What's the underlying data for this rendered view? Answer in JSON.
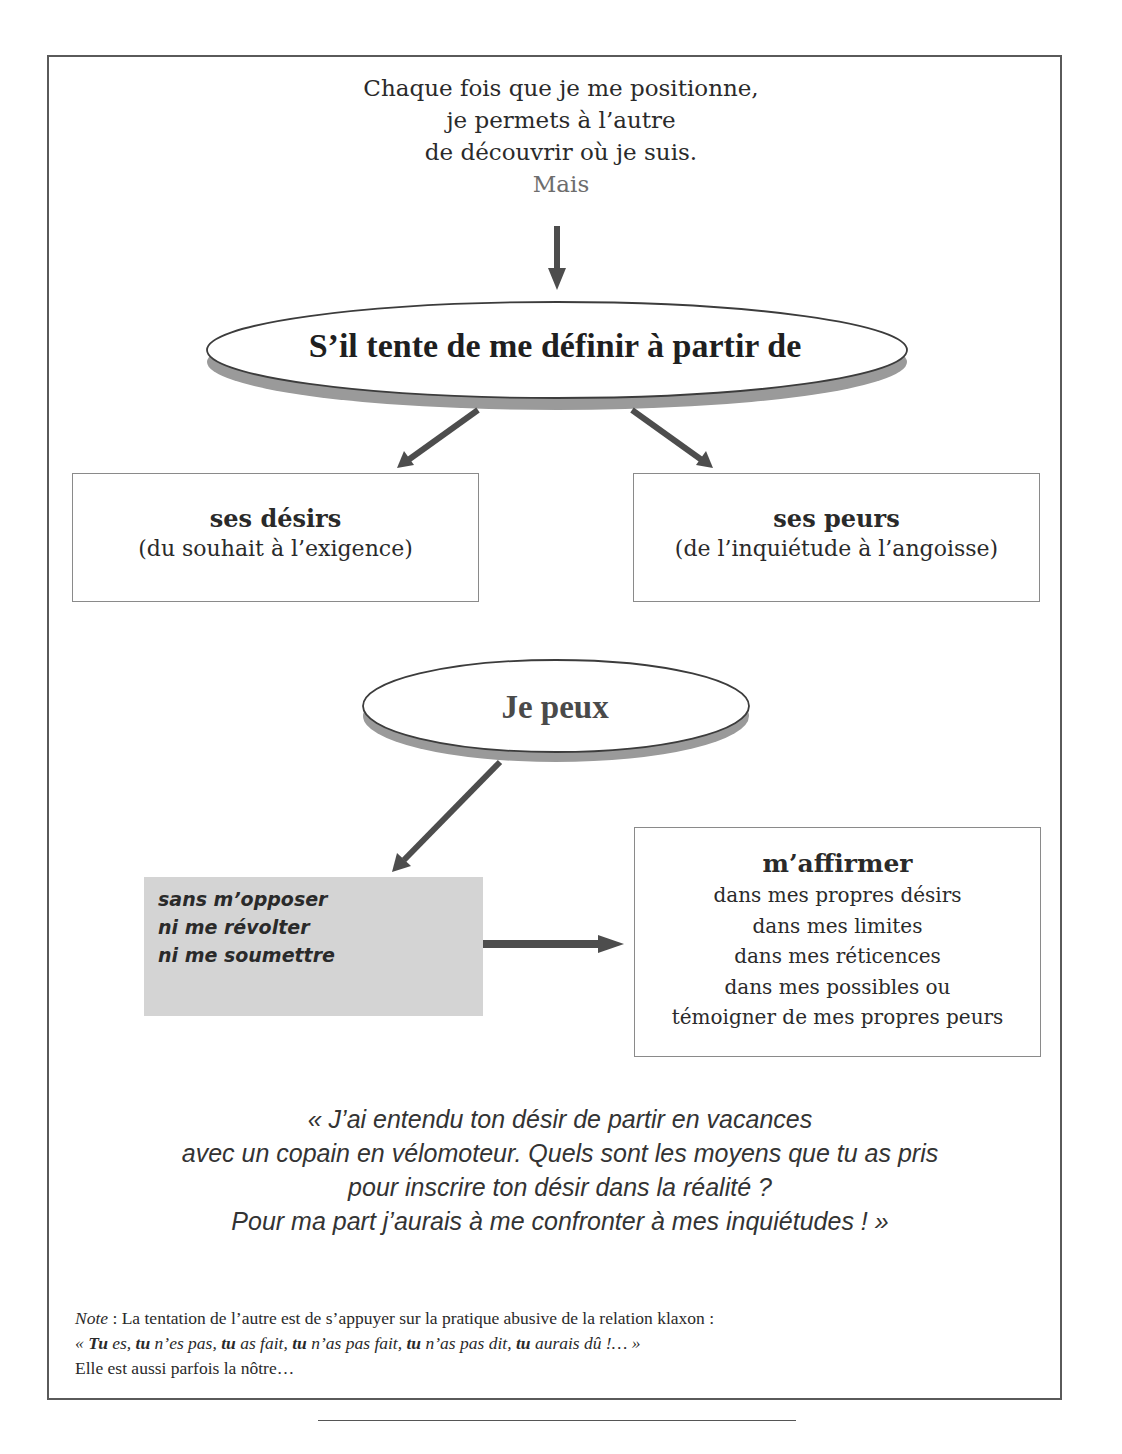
{
  "intro": {
    "lines": [
      "Chaque fois que je me positionne,",
      "je permets à l’autre",
      "de découvrir où je suis."
    ],
    "connector": "Mais"
  },
  "ellipse_top": {
    "label": "S’il tente de me définir à partir de"
  },
  "branch_left": {
    "title": "ses désirs",
    "subtitle": "(du souhait à l’exigence)"
  },
  "branch_right": {
    "title": "ses peurs",
    "subtitle": "(de l’inquiétude à l’angoisse)"
  },
  "ellipse_bottom": {
    "label": "Je peux"
  },
  "grey_box": {
    "lines": [
      "sans m’opposer",
      "ni me révolter",
      "ni me soumettre"
    ]
  },
  "affirm_box": {
    "title": "m’affirmer",
    "lines": [
      "dans mes propres désirs",
      "dans mes limites",
      "dans mes réticences",
      "dans mes possibles ou",
      "témoigner de mes propres peurs"
    ]
  },
  "quote": {
    "lines": [
      "« J’ai entendu ton désir de partir en vacances",
      "avec un copain en vélomoteur. Quels sont les moyens que tu as pris",
      "pour inscrire ton désir dans la réalité ?",
      "Pour ma part j’aurais à me confronter à mes inquiétudes ! »"
    ]
  },
  "note": {
    "label": "Note",
    "line1_rest": " : La tentation de l’autre est de s’appuyer sur la pratique abusive de la relation klaxon :",
    "line2_parts": [
      {
        "text": "« ",
        "bold": false
      },
      {
        "text": "Tu",
        "bold": true
      },
      {
        "text": " es, ",
        "bold": false
      },
      {
        "text": "tu",
        "bold": true
      },
      {
        "text": " n’es pas, ",
        "bold": false
      },
      {
        "text": "tu",
        "bold": true
      },
      {
        "text": " as fait, ",
        "bold": false
      },
      {
        "text": "tu",
        "bold": true
      },
      {
        "text": " n’as pas fait, ",
        "bold": false
      },
      {
        "text": "tu",
        "bold": true
      },
      {
        "text": " n’as pas dit, ",
        "bold": false
      },
      {
        "text": "tu",
        "bold": true
      },
      {
        "text": " aurais dû !… »",
        "bold": false
      }
    ],
    "line3": "Elle est aussi parfois la nôtre…"
  },
  "colors": {
    "arrow": "#4d4d4d",
    "ellipse_shadow": "#9a9a9a",
    "grey_box": "#d4d4d4",
    "frame": "#5a5a5a"
  }
}
